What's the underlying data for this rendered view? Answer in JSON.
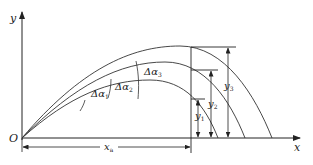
{
  "diagram": {
    "type": "projectile-trajectories",
    "axes": {
      "origin_label": "O",
      "x_label": "x",
      "y_label": "y"
    },
    "dimension": {
      "horizontal_label": "x",
      "horizontal_sub": "a"
    },
    "angles": [
      {
        "label": "Δα",
        "sub": "1"
      },
      {
        "label": "Δα",
        "sub": "2"
      },
      {
        "label": "Δα",
        "sub": "3"
      }
    ],
    "heights": [
      {
        "label": "y",
        "sub": "1"
      },
      {
        "label": "y",
        "sub": "2"
      },
      {
        "label": "y",
        "sub": "3"
      }
    ],
    "colors": {
      "stroke": "#333333",
      "background": "#ffffff"
    }
  }
}
